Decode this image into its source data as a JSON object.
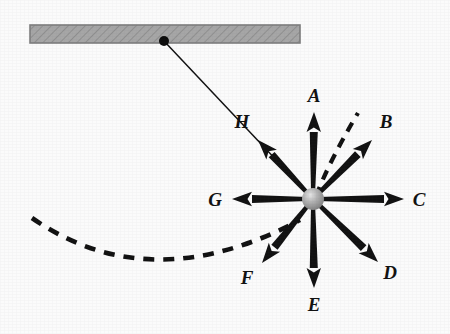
{
  "figure": {
    "background_color": "#fbfbfb",
    "ink_color": "#111111",
    "ceiling_color": "#a0a0a0",
    "ceiling_edge_color": "#7d7d7d",
    "bob_color": "#9a9a9a",
    "pivot_color": "#0d0d0d"
  },
  "chart_data": {
    "type": "diagram",
    "xlabel": "",
    "ylabel": "",
    "xlim": [
      0,
      450
    ],
    "ylim": [
      0,
      334
    ],
    "grid": false,
    "legend": "none",
    "annotations": [
      "Horizontal hatched ceiling support at top",
      "String from ceiling pivot down-right to the bob",
      "Eight labeled force-direction arrows radiating from the bob",
      "Dashed arc showing the swing path of the bob",
      "Short dashed curve near arrow B indicating the tangent/path direction"
    ],
    "ceiling": {
      "x_start": 30,
      "x_end": 300,
      "y_top": 25,
      "y_bottom": 43
    },
    "pivot": {
      "x": 164,
      "y": 41,
      "radius": 5
    },
    "bob": {
      "x": 313,
      "y": 199,
      "radius": 11
    },
    "string": {
      "from_x": 164,
      "from_y": 41,
      "to_x": 313,
      "to_y": 199
    },
    "swing_arc": {
      "style": "dashed",
      "start_x": 32,
      "start_y": 218,
      "control_x": 150,
      "control_y": 300,
      "end_x": 300,
      "end_y": 220
    },
    "tangent_dash": {
      "style": "dashed",
      "start_x": 316,
      "start_y": 196,
      "control_x": 330,
      "control_y": 160,
      "end_x": 358,
      "end_y": 113
    },
    "vectors": [
      {
        "label": "A",
        "angle_deg": 90,
        "tip_x": 314,
        "tip_y": 112,
        "label_x": 314,
        "label_y": 102,
        "length_px": 87,
        "direction": "up"
      },
      {
        "label": "B",
        "angle_deg": 40,
        "tip_x": 372,
        "tip_y": 140,
        "label_x": 386,
        "label_y": 128,
        "length_px": 80,
        "direction": "up-right"
      },
      {
        "label": "C",
        "angle_deg": 0,
        "tip_x": 404,
        "tip_y": 199,
        "label_x": 419,
        "label_y": 206,
        "length_px": 91,
        "direction": "right"
      },
      {
        "label": "D",
        "angle_deg": -41,
        "tip_x": 378,
        "tip_y": 262,
        "label_x": 390,
        "label_y": 279,
        "length_px": 87,
        "direction": "down-right"
      },
      {
        "label": "E",
        "angle_deg": -90,
        "tip_x": 314,
        "tip_y": 288,
        "label_x": 314,
        "label_y": 311,
        "length_px": 89,
        "direction": "down"
      },
      {
        "label": "F",
        "angle_deg": -129,
        "tip_x": 262,
        "tip_y": 263,
        "label_x": 247,
        "label_y": 284,
        "length_px": 81,
        "direction": "down-left"
      },
      {
        "label": "G",
        "angle_deg": 180,
        "tip_x": 232,
        "tip_y": 199,
        "label_x": 215,
        "label_y": 206,
        "length_px": 81,
        "direction": "left"
      },
      {
        "label": "H",
        "angle_deg": 137,
        "tip_x": 258,
        "tip_y": 140,
        "label_x": 242,
        "label_y": 128,
        "length_px": 78,
        "direction": "up-left"
      }
    ]
  }
}
